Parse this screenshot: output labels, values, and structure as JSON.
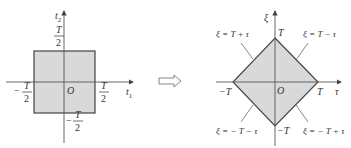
{
  "colors": {
    "fill": "#d9d9d9",
    "stroke": "#444444",
    "axis": "#555555",
    "text": "#333333",
    "background": "#ffffff"
  },
  "left_panel": {
    "title": "square region in (t1, t2) plane",
    "x_axis_label": "t",
    "x_axis_sub": "1",
    "y_axis_label": "t",
    "y_axis_sub": "2",
    "origin_label": "O",
    "top_label": {
      "num": "T",
      "den": "2",
      "sign": ""
    },
    "bottom_label": {
      "num": "T",
      "den": "2",
      "sign": "−"
    },
    "left_label": {
      "num": "T",
      "den": "2",
      "sign": "−"
    },
    "right_label": {
      "num": "T",
      "den": "2",
      "sign": ""
    }
  },
  "transform_arrow": "⇨",
  "right_panel": {
    "title": "diamond region in (τ, ξ) plane",
    "x_axis_label": "τ",
    "y_axis_label": "ξ",
    "origin_label": "O",
    "top_vertex": "T",
    "bottom_vertex": "−T",
    "left_vertex": "−T",
    "right_vertex": "T",
    "edge_upper_left": "ξ = T + τ",
    "edge_upper_right": "ξ = T − τ",
    "edge_lower_left": "ξ = − T − τ",
    "edge_lower_right": "ξ = − T + τ"
  }
}
